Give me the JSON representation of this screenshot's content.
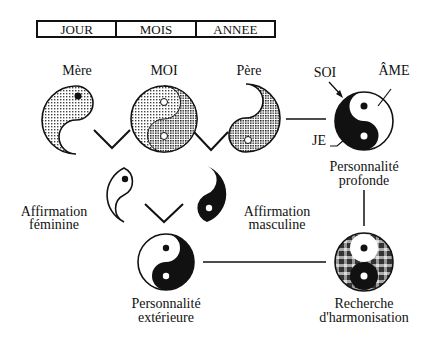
{
  "timebar": {
    "cells": [
      "JOUR",
      "MOIS",
      "ANNEE"
    ]
  },
  "top_row": {
    "mere": "Mère",
    "moi": "MOI",
    "pere": "Père"
  },
  "deep": {
    "soi": "SOI",
    "ame": "ÂME",
    "je": "JE",
    "label_line1": "Personnalité",
    "label_line2": "profonde"
  },
  "affirmation": {
    "feminine_line1": "Affirmation",
    "feminine_line2": "féminine",
    "masculine_line1": "Affirmation",
    "masculine_line2": "masculine"
  },
  "exterior": {
    "label_line1": "Personnalité",
    "label_line2": "extérieure"
  },
  "harmonisation": {
    "label_line1": "Recherche",
    "label_line2": "d'harmonisation"
  },
  "colors": {
    "ink": "#111111",
    "stipple": "#8a8a8a",
    "paper": "#ffffff"
  }
}
